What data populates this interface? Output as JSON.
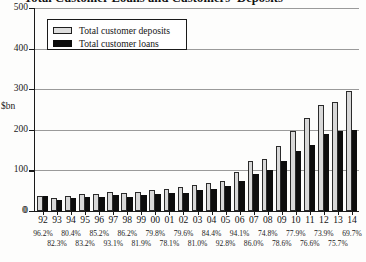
{
  "chart_data": {
    "type": "bar",
    "title": "Total Customer Loans and Customers' Deposits",
    "xlabel": "",
    "ylabel": "$bn",
    "ylim": [
      0,
      500
    ],
    "yticks": [
      0,
      100,
      200,
      300,
      400,
      500
    ],
    "grid": true,
    "legend_position": "top-left",
    "categories": [
      "92",
      "93",
      "94",
      "95",
      "96",
      "97",
      "98",
      "99",
      "00",
      "01",
      "02",
      "03",
      "04",
      "05",
      "06",
      "07",
      "08",
      "09",
      "10",
      "11",
      "12",
      "13",
      "14"
    ],
    "series": [
      {
        "name": "Total customer deposits",
        "color": "#d8d8d8",
        "values": [
          38,
          33,
          37,
          42,
          42,
          48,
          45,
          47,
          52,
          55,
          58,
          63,
          68,
          75,
          96,
          122,
          128,
          160,
          196,
          228,
          262,
          268,
          295
        ]
      },
      {
        "name": "Total customer loans",
        "color": "#0d0d0d",
        "values": [
          37,
          27,
          31,
          35,
          35,
          40,
          35,
          40,
          43,
          45,
          45,
          52,
          53,
          62,
          73,
          91,
          100,
          122,
          147,
          162,
          190,
          196,
          200
        ]
      }
    ],
    "ratio_label": "Loans to deposits ratio",
    "ratios": [
      {
        "year": "92",
        "value": "96.2%",
        "row": 0
      },
      {
        "year": "93",
        "value": "82.3%",
        "row": 1
      },
      {
        "year": "94",
        "value": "80.4%",
        "row": 0
      },
      {
        "year": "95",
        "value": "83.2%",
        "row": 1
      },
      {
        "year": "96",
        "value": "85.2%",
        "row": 0
      },
      {
        "year": "97",
        "value": "93.1%",
        "row": 1
      },
      {
        "year": "98",
        "value": "86.2%",
        "row": 0
      },
      {
        "year": "99",
        "value": "81.9%",
        "row": 1
      },
      {
        "year": "00",
        "value": "79.8%",
        "row": 0
      },
      {
        "year": "01",
        "value": "78.1%",
        "row": 1
      },
      {
        "year": "02",
        "value": "79.6%",
        "row": 0
      },
      {
        "year": "03",
        "value": "81.0%",
        "row": 1
      },
      {
        "year": "04",
        "value": "84.4%",
        "row": 0
      },
      {
        "year": "05",
        "value": "92.8%",
        "row": 1
      },
      {
        "year": "06",
        "value": "94.1%",
        "row": 0
      },
      {
        "year": "07",
        "value": "86.0%",
        "row": 1
      },
      {
        "year": "08",
        "value": "74.8%",
        "row": 0
      },
      {
        "year": "09",
        "value": "78.6%",
        "row": 1
      },
      {
        "year": "10",
        "value": "77.9%",
        "row": 0
      },
      {
        "year": "11",
        "value": "76.6%",
        "row": 1
      },
      {
        "year": "12",
        "value": "73.9%",
        "row": 0
      },
      {
        "year": "13",
        "value": "75.7%",
        "row": 1
      },
      {
        "year": "14",
        "value": "69.7%",
        "row": 0
      }
    ]
  },
  "legend": {
    "items": [
      {
        "label": "Total customer deposits"
      },
      {
        "label": "Total customer loans"
      }
    ]
  },
  "footnote": ""
}
